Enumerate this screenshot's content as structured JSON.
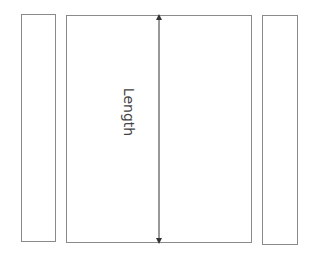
{
  "diagram": {
    "shapes": [
      {
        "id": "left-panel",
        "type": "rectangle"
      },
      {
        "id": "center-panel",
        "type": "rectangle"
      },
      {
        "id": "right-panel",
        "type": "rectangle"
      }
    ],
    "dimension": {
      "label": "Length",
      "orientation": "vertical",
      "arrow": "double-headed"
    },
    "colors": {
      "stroke": "#8a8a8a",
      "arrow": "#333333",
      "text": "#444444",
      "background": "#ffffff"
    }
  }
}
